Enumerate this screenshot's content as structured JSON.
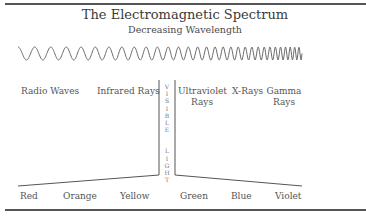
{
  "title": "The Electromagnetic Spectrum",
  "subtitle": "Decreasing Wavelength",
  "regions": [
    {
      "label": "Radio Waves"
    },
    {
      "label": "Infrared Rays"
    },
    {
      "label_line1": "Ultraviolet",
      "label_line2": "Rays"
    },
    {
      "label": "X-Rays"
    },
    {
      "label_line1": "Gamma",
      "label_line2": "Rays"
    }
  ],
  "visible_light": {
    "letters": [
      "V",
      "I",
      "S",
      "I",
      "B",
      "L",
      "E",
      "",
      "L",
      "I",
      "G",
      "H",
      "T"
    ],
    "label": "VISIBLE LIGHT"
  },
  "colors": [
    {
      "label": "Red"
    },
    {
      "label": "Orange"
    },
    {
      "label": "Yellow"
    },
    {
      "label": "Green"
    },
    {
      "label": "Blue"
    },
    {
      "label": "Violet"
    }
  ],
  "style": {
    "line_color": "#555555",
    "wave_color": "#6a6a6a"
  }
}
